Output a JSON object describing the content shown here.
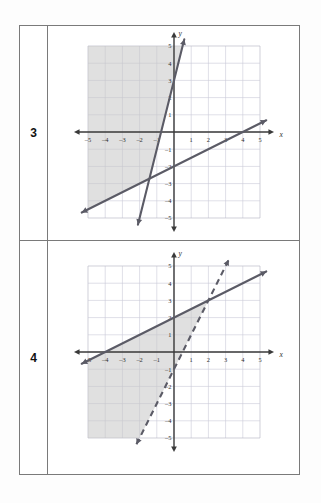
{
  "page": {
    "background_color": "#fdfdfd",
    "border_color": "#7a7a7a"
  },
  "rows": [
    {
      "number": "3"
    },
    {
      "number": "4"
    }
  ],
  "axes": {
    "x_name": "x",
    "y_name": "y",
    "x_ticks": [
      "-5",
      "-4",
      "-3",
      "-2",
      "-1",
      "1",
      "2",
      "3",
      "4",
      "5"
    ],
    "y_ticks": [
      "5",
      "4",
      "3",
      "2",
      "1",
      "-1",
      "-2",
      "-3",
      "-4",
      "-5"
    ],
    "xlim": [
      -5,
      5
    ],
    "ylim": [
      -5,
      5
    ],
    "grid": true
  },
  "chart_data": [
    {
      "id": "graph-3",
      "type": "line",
      "title": "3",
      "xlabel": "x",
      "ylabel": "y",
      "xlim": [
        -5,
        5
      ],
      "ylim": [
        -5,
        5
      ],
      "grid": true,
      "legend": "none",
      "shaded_region": {
        "description": "region above both lines",
        "fill_color": "#c6c6c6"
      },
      "series": [
        {
          "name": "steep-boundary",
          "style": "solid",
          "slope": 4,
          "intercept": 3,
          "equation": "y = 4x + 3",
          "points": [
            [
              -2,
              -5
            ],
            [
              0,
              3
            ],
            [
              0.5,
              5
            ]
          ],
          "arrows": "both"
        },
        {
          "name": "shallow-boundary",
          "style": "solid",
          "slope": 0.5,
          "intercept": -2,
          "equation": "y = 0.5x - 2",
          "points": [
            [
              -5,
              -4.5
            ],
            [
              0,
              -2
            ],
            [
              5,
              0.5
            ]
          ],
          "arrows": "both"
        }
      ]
    },
    {
      "id": "graph-4",
      "type": "line",
      "title": "4",
      "xlabel": "x",
      "ylabel": "y",
      "xlim": [
        -5,
        5
      ],
      "ylim": [
        -5,
        5
      ],
      "grid": true,
      "legend": "none",
      "shaded_region": {
        "description": "region below solid line and right of dashed line",
        "fill_color": "#c6c6c6"
      },
      "series": [
        {
          "name": "shallow-boundary",
          "style": "solid",
          "slope": 0.5,
          "intercept": 2,
          "equation": "y = 0.5x + 2",
          "points": [
            [
              -5,
              -0.5
            ],
            [
              -4,
              0
            ],
            [
              0,
              2
            ],
            [
              5,
              4.5
            ]
          ],
          "arrows": "both"
        },
        {
          "name": "steep-boundary",
          "style": "dashed",
          "slope": 2,
          "intercept": -1,
          "equation": "y = 2x - 1",
          "points": [
            [
              -2,
              -5
            ],
            [
              0,
              -1
            ],
            [
              2,
              3
            ],
            [
              3,
              5
            ]
          ],
          "arrows": "both"
        }
      ]
    }
  ]
}
